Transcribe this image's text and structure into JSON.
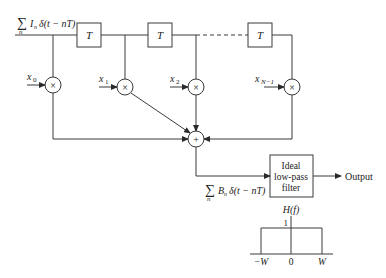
{
  "diagram": {
    "input_signal": {
      "sum": "∑",
      "sub": "n",
      "expr_a": "I",
      "expr_sub": "n",
      "expr_b": "δ(t − nT)"
    },
    "delays": [
      {
        "label": "T"
      },
      {
        "label": "T"
      },
      {
        "label": "T"
      }
    ],
    "taps": [
      {
        "label": "x",
        "sub": "0",
        "op": "×"
      },
      {
        "label": "x",
        "sub": "1",
        "op": "×"
      },
      {
        "label": "x",
        "sub": "2",
        "op": "×"
      },
      {
        "label": "x",
        "sub": "N−1",
        "op": "×"
      }
    ],
    "adder": {
      "op": "+"
    },
    "summed_signal": {
      "sum": "∑",
      "sub": "n",
      "expr_a": "B",
      "expr_sub": "n",
      "expr_b": "δ(t − nT)"
    },
    "filter": {
      "line1": "Ideal",
      "line2": "low-pass",
      "line3": "filter"
    },
    "output_label": "Output",
    "response": {
      "title": "H(f)",
      "peak": "1",
      "ticks": [
        "−W",
        "0",
        "W"
      ]
    }
  }
}
